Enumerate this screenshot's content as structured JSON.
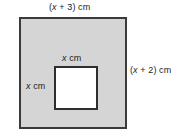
{
  "figure": {
    "outer_shape": {
      "name": "outer-square",
      "fill_color": "#d5d5d5",
      "border_color": "#3a3a3a",
      "width_label": "(x + 3) cm",
      "height_label": "(x + 2) cm"
    },
    "inner_shape": {
      "name": "inner-square",
      "fill_color": "#ffffff",
      "border_color": "#2e2e2e",
      "width_label": "x cm",
      "height_label": "x cm"
    },
    "labels": {
      "top": {
        "open_paren": "(",
        "variable": "x",
        "operator": " + ",
        "constant": "3",
        "close_paren": ")",
        "unit": " cm",
        "full_text": "(x + 3) cm"
      },
      "right": {
        "open_paren": "(",
        "variable": "x",
        "operator": " + ",
        "constant": "2",
        "close_paren": ")",
        "unit": " cm",
        "full_text": "(x + 2) cm"
      },
      "inner_top": {
        "variable": "x",
        "unit": " cm",
        "full_text": "x cm"
      },
      "inner_left": {
        "variable": "x",
        "unit": " cm",
        "full_text": "x cm"
      }
    }
  }
}
